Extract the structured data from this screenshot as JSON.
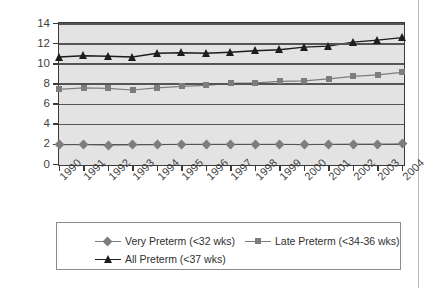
{
  "chart_data": {
    "type": "line",
    "title": "",
    "xlabel": "",
    "ylabel": "Percent",
    "ylim": [
      0,
      14
    ],
    "ytick_step": 2,
    "yticks": [
      "0",
      "2",
      "4",
      "6",
      "8",
      "10",
      "12",
      "14"
    ],
    "grid": true,
    "legend_position": "bottom",
    "categories": [
      "1990",
      "1991",
      "1992",
      "1993",
      "1994",
      "1995",
      "1996",
      "1997",
      "1998",
      "1999",
      "2000",
      "2001",
      "2002",
      "2003",
      "2004"
    ],
    "series": [
      {
        "name": "Very Preterm (<32 wks)",
        "marker": "diamond",
        "color": "#7d7d7d",
        "values": [
          1.92,
          1.92,
          1.86,
          1.89,
          1.93,
          1.96,
          1.94,
          1.95,
          1.96,
          1.96,
          1.93,
          1.96,
          1.97,
          1.97,
          2.0
        ]
      },
      {
        "name": "Late Preterm (<34-36 wks)",
        "marker": "square",
        "color": "#7d7d7d",
        "values": [
          7.4,
          7.55,
          7.5,
          7.35,
          7.55,
          7.7,
          7.8,
          8.0,
          8.05,
          8.2,
          8.25,
          8.45,
          8.7,
          8.85,
          9.1
        ]
      },
      {
        "name": "All Preterm (<37 wks)",
        "marker": "triangle",
        "color": "#1d1d1d",
        "values": [
          10.62,
          10.75,
          10.7,
          10.62,
          11.0,
          11.05,
          11.0,
          11.1,
          11.25,
          11.35,
          11.6,
          11.7,
          12.1,
          12.3,
          12.55
        ]
      }
    ]
  },
  "axis": {
    "y_title": "Percent"
  },
  "legend": {
    "entries": [
      {
        "label": "Very Preterm (<32 wks)"
      },
      {
        "label": "Late Preterm (<34-36 wks)"
      },
      {
        "label": "All Preterm (<37 wks)"
      }
    ]
  }
}
